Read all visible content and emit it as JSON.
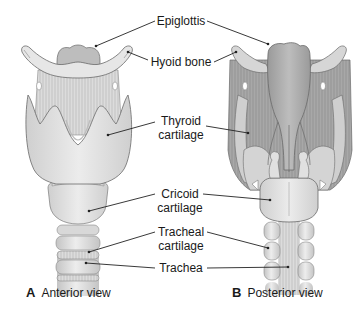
{
  "figure": {
    "panels": [
      {
        "letter": "A",
        "title": "Anterior view"
      },
      {
        "letter": "B",
        "title": "Posterior view"
      }
    ],
    "labels": {
      "epiglottis": "Epiglottis",
      "hyoid_bone": "Hyoid bone",
      "thyroid_cartilage_1": "Thyroid",
      "thyroid_cartilage_2": "cartilage",
      "cricoid_cartilage_1": "Cricoid",
      "cricoid_cartilage_2": "cartilage",
      "tracheal_cartilage_1": "Tracheal",
      "tracheal_cartilage_2": "cartilage",
      "trachea": "Trachea"
    },
    "colors": {
      "background": "#ffffff",
      "cartilage_light": "#e2e2e2",
      "cartilage_mid": "#cfcfcf",
      "posterior_dark": "#a9a9a9",
      "outline": "#6a6a6a",
      "leader_line": "#222222"
    }
  }
}
